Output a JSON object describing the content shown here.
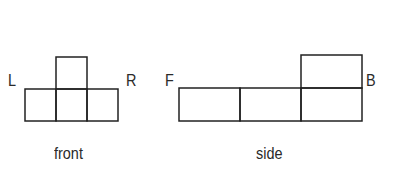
{
  "front_view": {
    "caption": "front",
    "left_label": "L",
    "right_label": "R",
    "grid": {
      "bottom_row_squares": 3,
      "top_squares_at": [
        1
      ]
    }
  },
  "side_view": {
    "caption": "side",
    "left_label": "F",
    "right_label": "B",
    "grid": {
      "bottom_row_squares": 3,
      "top_squares_at": [
        2
      ]
    }
  },
  "colors": {
    "line": "#222222",
    "background": "#ffffff"
  }
}
